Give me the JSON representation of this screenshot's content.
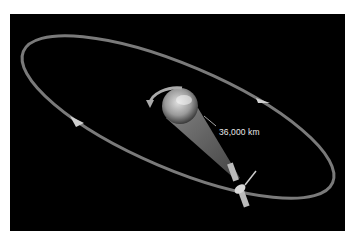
{
  "figure": {
    "distance_label": "36,000 km",
    "colors": {
      "background": "#000000",
      "orbit": "#8a8a8a",
      "frame": "#ffffff"
    }
  }
}
